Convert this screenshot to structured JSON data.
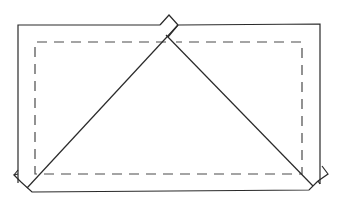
{
  "diagram": {
    "title": "",
    "colors": {
      "line": "#2a2a2a",
      "dashed": "#4a4a4a",
      "background": "#ffffff"
    },
    "outer_rect": {
      "top_y": 25,
      "left_x": 18,
      "right_x": 320,
      "bottom_y": 189
    },
    "dashed_rect": {
      "x1": 35,
      "y1": 42,
      "x2": 302,
      "y2": 174
    },
    "apex": {
      "x": 173,
      "y": 42
    },
    "labels": []
  }
}
